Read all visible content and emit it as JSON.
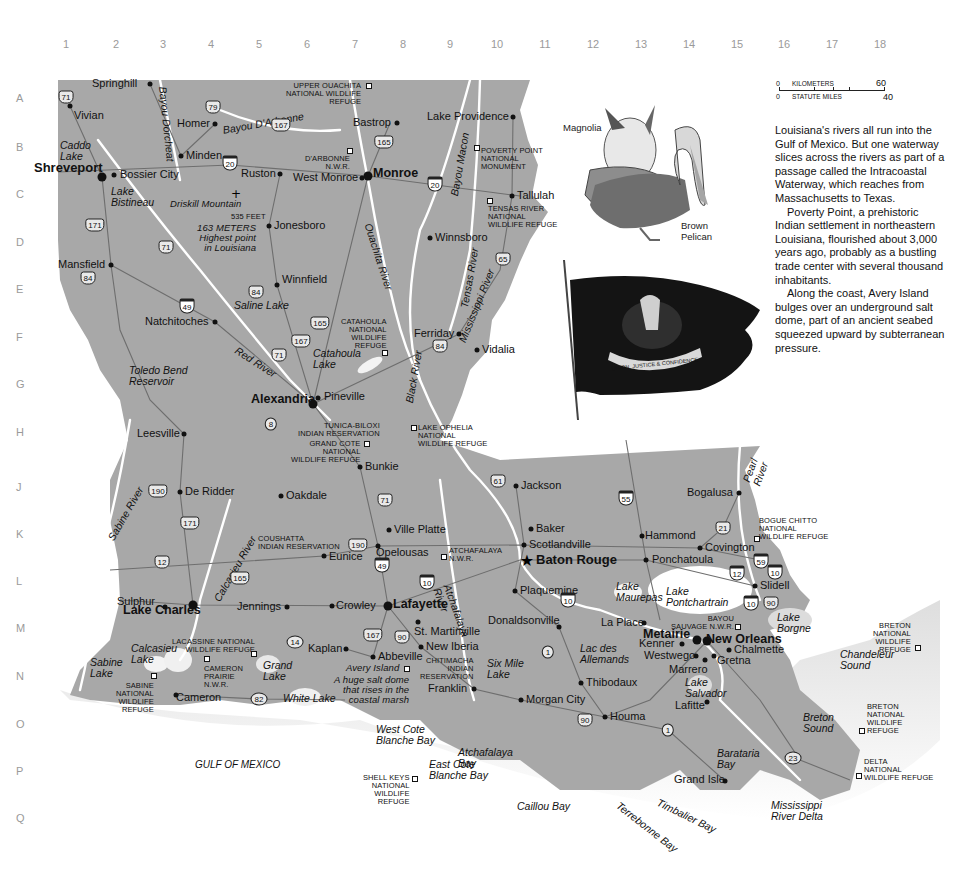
{
  "grid": {
    "columns": [
      "1",
      "2",
      "3",
      "4",
      "5",
      "6",
      "7",
      "8",
      "9",
      "10",
      "11",
      "12",
      "13",
      "14",
      "15",
      "16",
      "17",
      "18"
    ],
    "rows": [
      "A",
      "B",
      "C",
      "D",
      "E",
      "F",
      "G",
      "H",
      "J",
      "K",
      "L",
      "M",
      "N",
      "O",
      "P",
      "Q"
    ]
  },
  "scale_bar": {
    "km_start": "0",
    "km_label": "KILOMETERS",
    "km_end": "60",
    "mi_start": "0",
    "mi_label": "STATUTE MILES",
    "mi_end": "40"
  },
  "illustrations": {
    "magnolia": "Magnolia",
    "pelican": "Brown\nPelican",
    "flag_motto": "UNION, JUSTICE & CONFIDENCE"
  },
  "essay": {
    "paragraphs": [
      "Louisiana's rivers all run into the Gulf of Mexico. But one waterway slices across the rivers as part of a passage called the Intracoastal Waterway, which reaches from Massachusetts to Texas.",
      "Poverty Point, a prehistoric Indian settlement in northeastern Louisiana, flourished about 3,000 years ago, probably as a bustling trade center with several thousand inhabitants.",
      "Along the coast, Avery Island bulges over an underground salt dome, part of an ancient seabed squeezed upward by subterranean pressure."
    ]
  },
  "capital": {
    "name": "Baton Rouge"
  },
  "cities": [
    {
      "name": "Springhill",
      "x": 150,
      "y": 84,
      "lx": 92,
      "ly": 78
    },
    {
      "name": "Vivian",
      "x": 70,
      "y": 106,
      "lx": 74,
      "ly": 110
    },
    {
      "name": "Homer",
      "x": 215,
      "y": 124,
      "lx": 177,
      "ly": 118
    },
    {
      "name": "Bastrop",
      "x": 397,
      "y": 123,
      "lx": 353,
      "ly": 117
    },
    {
      "name": "Lake Providence",
      "x": 513,
      "y": 117,
      "lx": 427,
      "ly": 111
    },
    {
      "name": "Minden",
      "x": 181,
      "y": 156,
      "lx": 186,
      "ly": 150
    },
    {
      "name": "Shreveport",
      "x": 102,
      "y": 177,
      "lx": 34,
      "ly": 161,
      "big": true
    },
    {
      "name": "Bossier City",
      "x": 114,
      "y": 175,
      "lx": 120,
      "ly": 169
    },
    {
      "name": "Ruston",
      "x": 280,
      "y": 174,
      "lx": 241,
      "ly": 168
    },
    {
      "name": "West Monroe",
      "x": 362,
      "y": 178,
      "lx": 293,
      "ly": 172
    },
    {
      "name": "Monroe",
      "x": 368,
      "y": 176,
      "lx": 373,
      "ly": 167,
      "mid": true
    },
    {
      "name": "Tallulah",
      "x": 512,
      "y": 196,
      "lx": 517,
      "ly": 190
    },
    {
      "name": "Jonesboro",
      "x": 269,
      "y": 226,
      "lx": 274,
      "ly": 220
    },
    {
      "name": "Winnsboro",
      "x": 430,
      "y": 238,
      "lx": 435,
      "ly": 232
    },
    {
      "name": "Mansfield",
      "x": 111,
      "y": 265,
      "lx": 58,
      "ly": 259
    },
    {
      "name": "Winnfield",
      "x": 277,
      "y": 285,
      "lx": 282,
      "ly": 274
    },
    {
      "name": "Natchitoches",
      "x": 215,
      "y": 322,
      "lx": 145,
      "ly": 316
    },
    {
      "name": "Ferriday",
      "x": 459,
      "y": 334,
      "lx": 414,
      "ly": 328
    },
    {
      "name": "Vidalia",
      "x": 477,
      "y": 350,
      "lx": 482,
      "ly": 344
    },
    {
      "name": "Alexandria",
      "x": 313,
      "y": 404,
      "lx": 251,
      "ly": 393,
      "mid": true
    },
    {
      "name": "Pineville",
      "x": 318,
      "y": 398,
      "lx": 324,
      "ly": 391
    },
    {
      "name": "Leesville",
      "x": 184,
      "y": 434,
      "lx": 137,
      "ly": 428
    },
    {
      "name": "Bunkie",
      "x": 360,
      "y": 467,
      "lx": 365,
      "ly": 461
    },
    {
      "name": "Jackson",
      "x": 516,
      "y": 486,
      "lx": 521,
      "ly": 480
    },
    {
      "name": "Bogalusa",
      "x": 739,
      "y": 493,
      "lx": 687,
      "ly": 487
    },
    {
      "name": "De Ridder",
      "x": 180,
      "y": 492,
      "lx": 185,
      "ly": 486
    },
    {
      "name": "Oakdale",
      "x": 281,
      "y": 496,
      "lx": 286,
      "ly": 490
    },
    {
      "name": "Baker",
      "x": 531,
      "y": 529,
      "lx": 536,
      "ly": 523
    },
    {
      "name": "Ville Platte",
      "x": 389,
      "y": 530,
      "lx": 394,
      "ly": 524
    },
    {
      "name": "Hammond",
      "x": 642,
      "y": 536,
      "lx": 645,
      "ly": 530
    },
    {
      "name": "Scotlandville",
      "x": 524,
      "y": 545,
      "lx": 529,
      "ly": 539
    },
    {
      "name": "Covington",
      "x": 700,
      "y": 548,
      "lx": 705,
      "ly": 542
    },
    {
      "name": "Opelousas",
      "x": 378,
      "y": 546,
      "lx": 376,
      "ly": 547
    },
    {
      "name": "Eunice",
      "x": 324,
      "y": 556,
      "lx": 329,
      "ly": 551
    },
    {
      "name": "Ponchatoula",
      "x": 646,
      "y": 560,
      "lx": 652,
      "ly": 554
    },
    {
      "name": "Slidell",
      "x": 755,
      "y": 586,
      "lx": 760,
      "ly": 580
    },
    {
      "name": "Sulphur",
      "x": 165,
      "y": 607,
      "lx": 117,
      "ly": 596
    },
    {
      "name": "Lake Charles",
      "x": 193,
      "y": 605,
      "lx": 123,
      "ly": 604,
      "mid": true
    },
    {
      "name": "Jennings",
      "x": 287,
      "y": 607,
      "lx": 237,
      "ly": 601
    },
    {
      "name": "Crowley",
      "x": 332,
      "y": 606,
      "lx": 336,
      "ly": 600
    },
    {
      "name": "Lafayette",
      "x": 388,
      "y": 606,
      "lx": 393,
      "ly": 598,
      "mid": true
    },
    {
      "name": "Plaquemine",
      "x": 515,
      "y": 591,
      "lx": 520,
      "ly": 585
    },
    {
      "name": "St. Martinville",
      "x": 418,
      "y": 622,
      "lx": 414,
      "ly": 626
    },
    {
      "name": "Donaldsonville",
      "x": 559,
      "y": 627,
      "lx": 488,
      "ly": 615
    },
    {
      "name": "La Place",
      "x": 644,
      "y": 623,
      "lx": 601,
      "ly": 617
    },
    {
      "name": "Metairie",
      "x": 697,
      "y": 640,
      "lx": 643,
      "ly": 628,
      "mid": true
    },
    {
      "name": "New Orleans",
      "x": 707,
      "y": 641,
      "lx": 706,
      "ly": 633,
      "mid": true
    },
    {
      "name": "Kenner",
      "x": 682,
      "y": 644,
      "lx": 639,
      "ly": 638
    },
    {
      "name": "Westwego",
      "x": 696,
      "y": 656,
      "lx": 644,
      "ly": 650
    },
    {
      "name": "Chalmette",
      "x": 729,
      "y": 650,
      "lx": 734,
      "ly": 644
    },
    {
      "name": "Marrero",
      "x": 705,
      "y": 660,
      "lx": 669,
      "ly": 664
    },
    {
      "name": "Gretna",
      "x": 714,
      "y": 656,
      "lx": 717,
      "ly": 655
    },
    {
      "name": "Kaplan",
      "x": 346,
      "y": 649,
      "lx": 308,
      "ly": 643
    },
    {
      "name": "Abbeville",
      "x": 373,
      "y": 657,
      "lx": 378,
      "ly": 651
    },
    {
      "name": "New Iberia",
      "x": 421,
      "y": 647,
      "lx": 426,
      "ly": 641
    },
    {
      "name": "Thibodaux",
      "x": 581,
      "y": 683,
      "lx": 586,
      "ly": 677
    },
    {
      "name": "Franklin",
      "x": 474,
      "y": 689,
      "lx": 428,
      "ly": 683
    },
    {
      "name": "Morgan City",
      "x": 521,
      "y": 700,
      "lx": 526,
      "ly": 694
    },
    {
      "name": "Cameron",
      "x": 176,
      "y": 695,
      "lx": 176,
      "ly": 692
    },
    {
      "name": "Lafitte",
      "x": 707,
      "y": 702,
      "lx": 675,
      "ly": 700
    },
    {
      "name": "Houma",
      "x": 605,
      "y": 717,
      "lx": 610,
      "ly": 711
    },
    {
      "name": "Grand Isle",
      "x": 725,
      "y": 781,
      "lx": 674,
      "ly": 774
    }
  ],
  "water_features": [
    {
      "name": "Caddo\nLake",
      "x": 60,
      "y": 140
    },
    {
      "name": "Lake\nBistineau",
      "x": 111,
      "y": 186
    },
    {
      "name": "Saline Lake",
      "x": 234,
      "y": 300
    },
    {
      "name": "Catahoula\nLake",
      "x": 313,
      "y": 348
    },
    {
      "name": "Toledo Bend\nReservoir",
      "x": 129,
      "y": 365
    },
    {
      "name": "Lake\nMaurepas",
      "x": 616,
      "y": 581
    },
    {
      "name": "Lake\nPontchartrain",
      "x": 666,
      "y": 586
    },
    {
      "name": "Lake\nBorgne",
      "x": 777,
      "y": 612
    },
    {
      "name": "Lac des\nAllemands",
      "x": 580,
      "y": 643
    },
    {
      "name": "Lake\nSalvador",
      "x": 685,
      "y": 677
    },
    {
      "name": "Six Mile\nLake",
      "x": 487,
      "y": 658
    },
    {
      "name": "Calcasieu\nLake",
      "x": 131,
      "y": 643
    },
    {
      "name": "Sabine\nLake",
      "x": 90,
      "y": 657
    },
    {
      "name": "Grand\nLake",
      "x": 263,
      "y": 660
    },
    {
      "name": "White Lake",
      "x": 283,
      "y": 693
    },
    {
      "name": "Chandeleur\nSound",
      "x": 840,
      "y": 649
    },
    {
      "name": "Breton\nSound",
      "x": 803,
      "y": 712
    },
    {
      "name": "Barataria\nBay",
      "x": 717,
      "y": 748
    },
    {
      "name": "Atchafalaya\nBay",
      "x": 458,
      "y": 747
    },
    {
      "name": "West Cote\nBlanche Bay",
      "x": 376,
      "y": 724
    },
    {
      "name": "East Cote\nBlanche Bay",
      "x": 429,
      "y": 759
    },
    {
      "name": "Caillou Bay",
      "x": 517,
      "y": 801
    },
    {
      "name": "Mississippi\nRiver Delta",
      "x": 771,
      "y": 800
    },
    {
      "name": "GULF OF MEXICO",
      "x": 195,
      "y": 760
    }
  ],
  "rivers": [
    {
      "name": "Bayou Dorcheat",
      "x": 168,
      "y": 86,
      "rot": 84
    },
    {
      "name": "Bayou D'Arbonne",
      "x": 222,
      "y": 125,
      "rot": -10
    },
    {
      "name": "Bayou Macon",
      "x": 449,
      "y": 195,
      "rot": -80
    },
    {
      "name": "Ouachita River",
      "x": 373,
      "y": 222,
      "rot": 72
    },
    {
      "name": "Tensas River",
      "x": 459,
      "y": 307,
      "rot": -80
    },
    {
      "name": "Mississippi River",
      "x": 457,
      "y": 340,
      "rot": -68
    },
    {
      "name": "Black River",
      "x": 404,
      "y": 402,
      "rot": -80
    },
    {
      "name": "Red River",
      "x": 239,
      "y": 345,
      "rot": 33
    },
    {
      "name": "Sabine River",
      "x": 106,
      "y": 537,
      "rot": -60
    },
    {
      "name": "Calcasieu River",
      "x": 212,
      "y": 598,
      "rot": -60
    },
    {
      "name": "Atchafalaya\nRiver",
      "x": 452,
      "y": 583,
      "rot": 70
    },
    {
      "name": "Pearl\nRiver",
      "x": 741,
      "y": 480,
      "rot": -70
    },
    {
      "name": "Terrebonne Bay",
      "x": 621,
      "y": 800,
      "rot": 38
    },
    {
      "name": "Timbalier Bay",
      "x": 660,
      "y": 797,
      "rot": 26
    }
  ],
  "landmarks": [
    {
      "name": "UPPER OUACHITA\nNATIONAL WILDLIFE\nREFUGE",
      "x": 286,
      "y": 82,
      "align": "right",
      "sq": [
        369,
        86
      ]
    },
    {
      "name": "D'ARBONNE\nN.W.R.",
      "x": 305,
      "y": 155,
      "align": "right",
      "sq": [
        350,
        151
      ]
    },
    {
      "name": "POVERTY POINT\nNATIONAL\nMONUMENT",
      "x": 481,
      "y": 147,
      "align": "left",
      "sq": [
        477,
        148
      ]
    },
    {
      "name": "TENSAS RIVER\nNATIONAL\nWILDLIFE REFUGE",
      "x": 488,
      "y": 205,
      "align": "left",
      "sq": [
        490,
        201
      ]
    },
    {
      "name": "Driskill Mountain",
      "x": 170,
      "y": 199,
      "italic": true
    },
    {
      "name": "535 FEET",
      "x": 231,
      "y": 213,
      "align": "right"
    },
    {
      "name": "163 METERS\nHighest point\nin Louisiana",
      "x": 197,
      "y": 223,
      "align": "right",
      "italic": true
    },
    {
      "name": "CATAHOULA\nNATIONAL\nWILDLIFE\nREFUGE",
      "x": 341,
      "y": 318,
      "align": "right",
      "sq": [
        385,
        353
      ]
    },
    {
      "name": "TUNICA-BILOXI\nINDIAN RESERVATION",
      "x": 298,
      "y": 422,
      "align": "right"
    },
    {
      "name": "LAKE OPHELIA\nNATIONAL\nWILDLIFE REFUGE",
      "x": 418,
      "y": 424,
      "align": "left",
      "sq": [
        414,
        428
      ]
    },
    {
      "name": "GRAND COTE\nNATIONAL\nWILDLIFE REFUGE",
      "x": 291,
      "y": 440,
      "align": "right",
      "sq": [
        367,
        444
      ]
    },
    {
      "name": "COUSHATTA\nINDIAN RESERVATION",
      "x": 258,
      "y": 535,
      "align": "left"
    },
    {
      "name": "ATCHAFALAYA\nN.W.R.",
      "x": 449,
      "y": 547,
      "align": "left",
      "sq": [
        444,
        557
      ]
    },
    {
      "name": "BOGUE CHITTO\nNATIONAL\nWILDLIFE REFUGE",
      "x": 759,
      "y": 517,
      "align": "left",
      "sq": [
        757,
        539
      ]
    },
    {
      "name": "BAYOU\nSAUVAGE N.W.R.",
      "x": 671,
      "y": 615,
      "align": "right",
      "sq": [
        738,
        627
      ]
    },
    {
      "name": "LACASSINE NATIONAL\nWILDLIFE REFUGE",
      "x": 172,
      "y": 638,
      "align": "right",
      "sq": [
        254,
        654
      ]
    },
    {
      "name": "CAMERON\nPRAIRIE\nN.W.R.",
      "x": 204,
      "y": 665,
      "align": "left",
      "sq": [
        207,
        659
      ]
    },
    {
      "name": "SABINE\nNATIONAL\nWILDLIFE\nREFUGE",
      "x": 116,
      "y": 682,
      "align": "right",
      "sq": [
        154,
        676
      ]
    },
    {
      "name": "Avery Island",
      "x": 346,
      "y": 663,
      "italic": true,
      "sq": [
        407,
        669
      ]
    },
    {
      "name": "A huge salt dome\nthat rises in the\ncoastal marsh",
      "x": 334,
      "y": 675,
      "align": "right",
      "italic": true
    },
    {
      "name": "CHITIMACHA\nINDIAN\nRESERVATION",
      "x": 420,
      "y": 657,
      "align": "right"
    },
    {
      "name": "SHELL KEYS\nNATIONAL\nWILDLIFE\nREFUGE",
      "x": 363,
      "y": 774,
      "align": "right",
      "sq": [
        415,
        779
      ]
    },
    {
      "name": "BRETON\nNATIONAL\nWILDLIFE\nREFUGE",
      "x": 873,
      "y": 622,
      "align": "right",
      "sq": [
        918,
        648
      ]
    },
    {
      "name": "BRETON\nNATIONAL\nWILDLIFE\nREFUGE",
      "x": 867,
      "y": 703,
      "align": "left",
      "sq": [
        862,
        731
      ]
    },
    {
      "name": "DELTA\nNATIONAL\nWILDLIFE REFUGE",
      "x": 864,
      "y": 758,
      "align": "left",
      "sq": [
        859,
        776
      ]
    }
  ],
  "routes": [
    {
      "n": "71",
      "x": 66,
      "y": 97,
      "t": "us"
    },
    {
      "n": "79",
      "x": 213,
      "y": 107,
      "t": "us"
    },
    {
      "n": "167",
      "x": 281,
      "y": 125,
      "t": "us"
    },
    {
      "n": "165",
      "x": 384,
      "y": 142,
      "t": "us"
    },
    {
      "n": "20",
      "x": 230,
      "y": 163,
      "t": "i"
    },
    {
      "n": "20",
      "x": 435,
      "y": 184,
      "t": "i"
    },
    {
      "n": "171",
      "x": 95,
      "y": 225,
      "t": "us"
    },
    {
      "n": "71",
      "x": 166,
      "y": 247,
      "t": "us"
    },
    {
      "n": "84",
      "x": 88,
      "y": 278,
      "t": "us"
    },
    {
      "n": "65",
      "x": 503,
      "y": 259,
      "t": "us"
    },
    {
      "n": "84",
      "x": 256,
      "y": 292,
      "t": "us"
    },
    {
      "n": "49",
      "x": 187,
      "y": 306,
      "t": "i"
    },
    {
      "n": "165",
      "x": 320,
      "y": 323,
      "t": "us"
    },
    {
      "n": "167",
      "x": 301,
      "y": 341,
      "t": "us"
    },
    {
      "n": "71",
      "x": 279,
      "y": 355,
      "t": "us"
    },
    {
      "n": "84",
      "x": 440,
      "y": 346,
      "t": "us"
    },
    {
      "n": "8",
      "x": 271,
      "y": 424,
      "t": "st"
    },
    {
      "n": "61",
      "x": 498,
      "y": 481,
      "t": "us"
    },
    {
      "n": "55",
      "x": 626,
      "y": 498,
      "t": "i"
    },
    {
      "n": "190",
      "x": 158,
      "y": 491,
      "t": "us"
    },
    {
      "n": "71",
      "x": 385,
      "y": 500,
      "t": "us"
    },
    {
      "n": "171",
      "x": 190,
      "y": 523,
      "t": "us"
    },
    {
      "n": "21",
      "x": 723,
      "y": 528,
      "t": "us"
    },
    {
      "n": "190",
      "x": 358,
      "y": 545,
      "t": "us"
    },
    {
      "n": "12",
      "x": 162,
      "y": 562,
      "t": "us"
    },
    {
      "n": "49",
      "x": 382,
      "y": 565,
      "t": "i"
    },
    {
      "n": "59",
      "x": 761,
      "y": 561,
      "t": "i"
    },
    {
      "n": "10",
      "x": 427,
      "y": 582,
      "t": "i"
    },
    {
      "n": "165",
      "x": 240,
      "y": 578,
      "t": "us"
    },
    {
      "n": "10",
      "x": 775,
      "y": 572,
      "t": "i"
    },
    {
      "n": "12",
      "x": 737,
      "y": 573,
      "t": "i"
    },
    {
      "n": "10",
      "x": 568,
      "y": 600,
      "t": "i"
    },
    {
      "n": "10",
      "x": 751,
      "y": 603,
      "t": "i"
    },
    {
      "n": "90",
      "x": 771,
      "y": 603,
      "t": "us"
    },
    {
      "n": "167",
      "x": 373,
      "y": 635,
      "t": "us"
    },
    {
      "n": "90",
      "x": 402,
      "y": 637,
      "t": "us"
    },
    {
      "n": "14",
      "x": 295,
      "y": 642,
      "t": "st"
    },
    {
      "n": "1",
      "x": 548,
      "y": 652,
      "t": "st"
    },
    {
      "n": "82",
      "x": 259,
      "y": 699,
      "t": "st"
    },
    {
      "n": "90",
      "x": 585,
      "y": 720,
      "t": "us"
    },
    {
      "n": "1",
      "x": 668,
      "y": 730,
      "t": "st"
    },
    {
      "n": "23",
      "x": 793,
      "y": 758,
      "t": "st"
    }
  ],
  "colors": {
    "land": "#a8a8a8",
    "water": "#ffffff",
    "shore": "#d9d9d9",
    "road": "#6e6e6e",
    "grid_text": "#9a9a9a"
  }
}
